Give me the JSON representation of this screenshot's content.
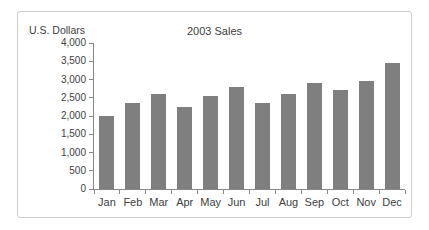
{
  "chart_data": {
    "type": "bar",
    "title": "2003 Sales",
    "ylabel": "U.S. Dollars",
    "xlabel": "",
    "categories": [
      "Jan",
      "Feb",
      "Mar",
      "Apr",
      "May",
      "Jun",
      "Jul",
      "Aug",
      "Sep",
      "Oct",
      "Nov",
      "Dec"
    ],
    "values": [
      2000,
      2350,
      2600,
      2250,
      2550,
      2800,
      2350,
      2600,
      2900,
      2700,
      2950,
      3450
    ],
    "ylim": [
      0,
      4000
    ],
    "ytick_step": 500,
    "ytick_labels": [
      "0",
      "500",
      "1,000",
      "1,500",
      "2,000",
      "2,500",
      "3,000",
      "3,500",
      "4,000"
    ],
    "grid": false,
    "legend_position": "none",
    "bar_color": "#7f7f7f",
    "axis_color": "#878787",
    "text_color": "#404040",
    "frame_border_color": "#cdcdcd"
  }
}
